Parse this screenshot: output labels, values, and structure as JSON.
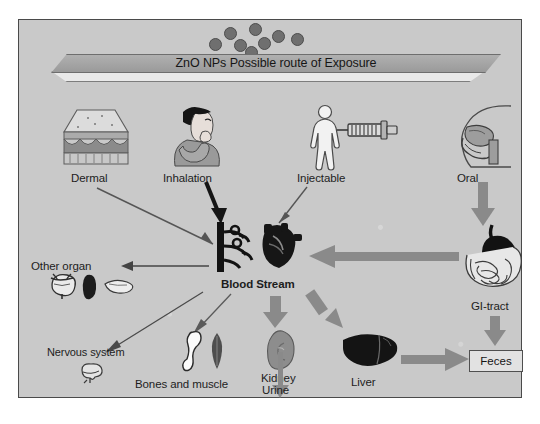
{
  "figure": {
    "banner": {
      "title": "ZnO NPs Possible route of Exposure"
    },
    "nanoparticles": {
      "count": 8,
      "color": "#6f6f6f"
    },
    "exposure_routes": [
      {
        "id": "dermal",
        "label": "Dermal",
        "icon": "skin-cross-section-icon"
      },
      {
        "id": "inhalation",
        "label": "Inhalation",
        "icon": "woman-inhaling-icon"
      },
      {
        "id": "injectable",
        "label": "Injectable",
        "icon": "body-with-syringe-icon"
      },
      {
        "id": "oral",
        "label": "Oral",
        "icon": "head-mouth-throat-icon"
      }
    ],
    "central": {
      "label": "Blood Stream",
      "icon": "blood-vessel-and-heart-icon"
    },
    "targets": [
      {
        "id": "other-organ",
        "label": "Other organ",
        "icon": "bladder-spleen-pancreas-icon"
      },
      {
        "id": "nervous-system",
        "label": "Nervous system",
        "icon": "brain-icon"
      },
      {
        "id": "bones-muscle",
        "label": "Bones and muscle",
        "icon": "bone-and-muscle-icon"
      },
      {
        "id": "kidney",
        "label": "Kidney",
        "icon": "kidney-icon"
      },
      {
        "id": "liver",
        "label": "Liver",
        "icon": "liver-icon"
      },
      {
        "id": "gi-tract",
        "label": "GI-tract",
        "icon": "stomach-intestine-icon"
      }
    ],
    "excretions": [
      {
        "id": "urine",
        "label": "Urine"
      },
      {
        "id": "feces",
        "label": "Feces"
      }
    ],
    "colors": {
      "background": "#c9c9c9",
      "frame": "#4a4a4a",
      "banner_fill": "#a5a5a5",
      "gray_arrow": "#8a8a8a",
      "black_arrow": "#151515",
      "thin_arrow": "#555555"
    }
  }
}
